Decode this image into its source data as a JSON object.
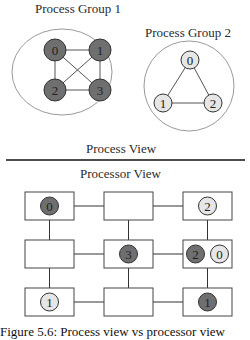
{
  "process_view": {
    "title": "Process View",
    "groups": [
      {
        "title": "Process Group 1",
        "nodes": [
          {
            "id": "0",
            "x": 55,
            "y": 50,
            "fill": "#6f6f6f"
          },
          {
            "id": "1",
            "x": 100,
            "y": 50,
            "fill": "#6f6f6f"
          },
          {
            "id": "2",
            "x": 55,
            "y": 90,
            "fill": "#6f6f6f"
          },
          {
            "id": "3",
            "x": 100,
            "y": 90,
            "fill": "#6f6f6f"
          }
        ],
        "edges": [
          [
            "0",
            "1"
          ],
          [
            "0",
            "2"
          ],
          [
            "1",
            "3"
          ],
          [
            "2",
            "3"
          ],
          [
            "0",
            "3"
          ],
          [
            "1",
            "2"
          ]
        ]
      },
      {
        "title": "Process Group 2",
        "nodes": [
          {
            "id": "0",
            "x": 190,
            "y": 60,
            "fill": "#e6e6e6"
          },
          {
            "id": "1",
            "x": 163,
            "y": 103,
            "fill": "#e6e6e6"
          },
          {
            "id": "2",
            "x": 213,
            "y": 103,
            "fill": "#e6e6e6"
          }
        ],
        "edges": [
          [
            "0",
            "1"
          ],
          [
            "0",
            "2"
          ],
          [
            "1",
            "2"
          ]
        ]
      }
    ]
  },
  "processor_view": {
    "title": "Processor View",
    "grid": {
      "rows": 3,
      "cols": 3,
      "cells": [
        {
          "row": 0,
          "col": 0,
          "processes": [
            {
              "label": "0",
              "group": 1
            }
          ]
        },
        {
          "row": 0,
          "col": 1,
          "processes": []
        },
        {
          "row": 0,
          "col": 2,
          "processes": [
            {
              "label": "2",
              "group": 2
            }
          ]
        },
        {
          "row": 1,
          "col": 0,
          "processes": []
        },
        {
          "row": 1,
          "col": 1,
          "processes": [
            {
              "label": "3",
              "group": 1
            }
          ]
        },
        {
          "row": 1,
          "col": 2,
          "processes": [
            {
              "label": "2",
              "group": 1
            },
            {
              "label": "0",
              "group": 2
            }
          ]
        },
        {
          "row": 2,
          "col": 0,
          "processes": [
            {
              "label": "1",
              "group": 2
            }
          ]
        },
        {
          "row": 2,
          "col": 1,
          "processes": []
        },
        {
          "row": 2,
          "col": 2,
          "processes": [
            {
              "label": "1",
              "group": 1
            }
          ]
        }
      ]
    }
  },
  "caption": "Figure 5.6: Process view vs processor view",
  "colors": {
    "group1_fill": "#6f6f6f",
    "group2_fill": "#e6e6e6",
    "stroke": "#333333",
    "outline": "#9a9a9a"
  }
}
